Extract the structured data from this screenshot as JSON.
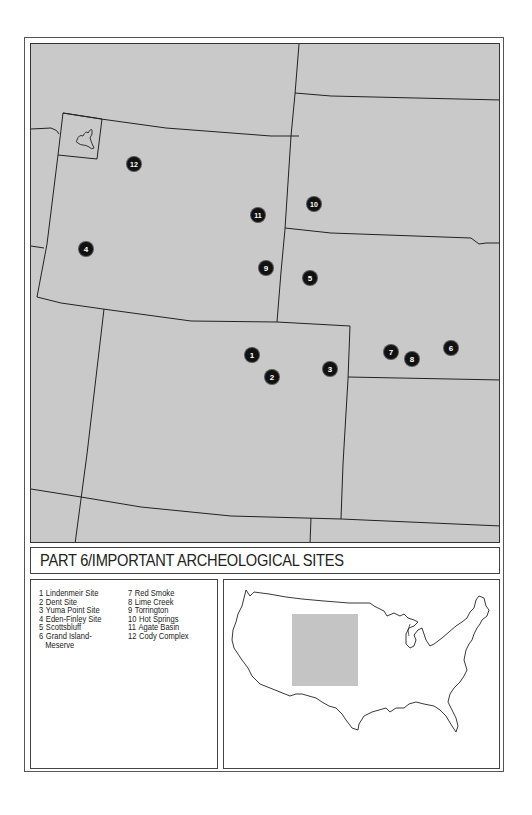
{
  "title": "PART 6/IMPORTANT ARCHEOLOGICAL SITES",
  "map": {
    "background_color": "#c9c9c9",
    "line_color": "#222222",
    "marker_color": "#111111",
    "inset_label": "Yellowstone",
    "sites": [
      {
        "id": 1,
        "label": "1",
        "name": "Lindenmeir Site",
        "x": 221,
        "y": 311
      },
      {
        "id": 2,
        "label": "2",
        "name": "Dent Site",
        "x": 241,
        "y": 333
      },
      {
        "id": 3,
        "label": "3",
        "name": "Yuma Point Site",
        "x": 299,
        "y": 325
      },
      {
        "id": 4,
        "label": "4",
        "name": "Eden-Finley Site",
        "x": 55,
        "y": 205
      },
      {
        "id": 5,
        "label": "5",
        "name": "Scottsbluff",
        "x": 279,
        "y": 234
      },
      {
        "id": 6,
        "label": "6",
        "name": "Grand Island-Meserve",
        "x": 420,
        "y": 304
      },
      {
        "id": 7,
        "label": "7",
        "name": "Red Smoke",
        "x": 360,
        "y": 308
      },
      {
        "id": 8,
        "label": "8",
        "name": "Lime Creek",
        "x": 381,
        "y": 315
      },
      {
        "id": 9,
        "label": "9",
        "name": "Torrington",
        "x": 235,
        "y": 224
      },
      {
        "id": 10,
        "label": "10",
        "name": "Hot Springs",
        "x": 283,
        "y": 160
      },
      {
        "id": 11,
        "label": "11",
        "name": "Agate Basin",
        "x": 227,
        "y": 171
      },
      {
        "id": 12,
        "label": "12",
        "name": "Cody Complex",
        "x": 103,
        "y": 120
      }
    ]
  },
  "legend": {
    "column1": [
      {
        "num": "1",
        "text": "Lindenmeir Site"
      },
      {
        "num": "2",
        "text": "Dent Site"
      },
      {
        "num": "3",
        "text": "Yuma Point Site"
      },
      {
        "num": "4",
        "text": "Eden-Finley Site"
      },
      {
        "num": "5",
        "text": "Scottsbluff"
      },
      {
        "num": "6",
        "text": "Grand Island-",
        "cont": "Meserve"
      }
    ],
    "column2": [
      {
        "num": "7",
        "text": "Red Smoke"
      },
      {
        "num": "8",
        "text": "Lime Creek"
      },
      {
        "num": "9",
        "text": "Torrington"
      },
      {
        "num": "10",
        "text": "Hot Springs"
      },
      {
        "num": "11",
        "text": "Agate Basin"
      },
      {
        "num": "12",
        "text": "Cody Complex"
      }
    ]
  },
  "inset": {
    "highlight_color": "#c4c4c4",
    "outline_color": "#222222"
  }
}
